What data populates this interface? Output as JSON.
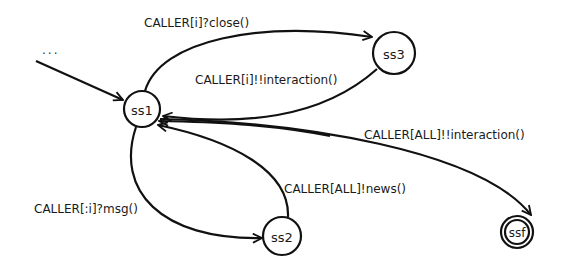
{
  "diagram": {
    "type": "state-machine",
    "entry_label": "...",
    "nodes": [
      {
        "id": "ss1",
        "label": "ss1",
        "final": false
      },
      {
        "id": "ss3",
        "label": "ss3",
        "final": false
      },
      {
        "id": "ss2",
        "label": "ss2",
        "final": false
      },
      {
        "id": "ssf",
        "label": "ssf",
        "final": true
      }
    ],
    "edges": [
      {
        "from": "entry",
        "to": "ss1",
        "label": ""
      },
      {
        "from": "ss1",
        "to": "ss3",
        "label": "CALLER[i]?close()"
      },
      {
        "from": "ss3",
        "to": "ss1",
        "label": "CALLER[i]!!interaction()"
      },
      {
        "from": "ss1",
        "to": "ssf",
        "label": "CALLER[ALL]!!interaction()"
      },
      {
        "from": "ss1",
        "to": "ss2",
        "label": "CALLER[:i]?msg()"
      },
      {
        "from": "ss2",
        "to": "ss1",
        "label": "CALLER[ALL]!news()"
      }
    ]
  }
}
